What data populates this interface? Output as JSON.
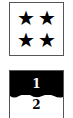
{
  "rating_card": {
    "stars": [
      "★",
      "★",
      "★",
      "★"
    ],
    "star_count": 4
  },
  "page_indicator": {
    "pages": [
      "1",
      "2"
    ],
    "current": "1",
    "active_color": "#000000"
  }
}
